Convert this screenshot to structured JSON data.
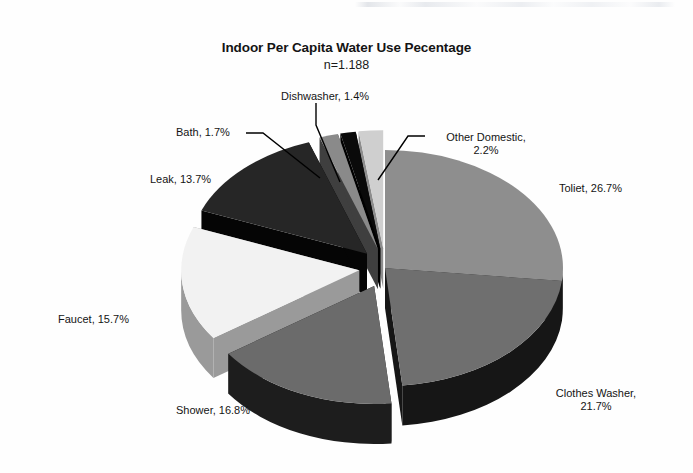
{
  "chart_data": {
    "type": "pie",
    "title": "Indoor Per Capita Water Use Pecentage",
    "subtitle": "n=1.188",
    "xlabel": "",
    "ylabel": "",
    "legend": "none",
    "style": "3d-exploded-pie",
    "grid": false,
    "units": "percent",
    "categories": [
      "Toliet",
      "Clothes Washer",
      "Shower",
      "Faucet",
      "Leak",
      "Bath",
      "Dishwasher",
      "Other Domestic"
    ],
    "values": [
      26.7,
      21.7,
      16.8,
      15.7,
      13.7,
      1.7,
      1.4,
      2.2
    ],
    "slices": [
      {
        "name": "Toliet",
        "value": 26.7,
        "label": "Toliet, 26.7%",
        "color": "#8e8e8e",
        "side_color": "#3a3a3a",
        "exploded": false
      },
      {
        "name": "Clothes Washer",
        "value": 21.7,
        "label": "Clothes Washer,|21.7%",
        "color": "#6f6f6f",
        "side_color": "#161616",
        "exploded": false
      },
      {
        "name": "Shower",
        "value": 16.8,
        "label": "Shower, 16.8%",
        "color": "#6b6b6b",
        "side_color": "#1d1d1d",
        "exploded": true
      },
      {
        "name": "Faucet",
        "value": 15.7,
        "label": "Faucet, 15.7%",
        "color": "#f2f2f2",
        "side_color": "#9a9a9a",
        "exploded": true
      },
      {
        "name": "Leak",
        "value": 13.7,
        "label": "Leak, 13.7%",
        "color": "#262626",
        "side_color": "#050505",
        "exploded": true
      },
      {
        "name": "Bath",
        "value": 1.7,
        "label": "Bath, 1.7%",
        "color": "#8a8a8a",
        "side_color": "#3f3f3f",
        "exploded": true
      },
      {
        "name": "Dishwasher",
        "value": 1.4,
        "label": "Dishwasher, 1.4%",
        "color": "#0a0a0a",
        "side_color": "#000000",
        "exploded": true
      },
      {
        "name": "Other Domestic",
        "value": 2.2,
        "label": "Other Domestic,|2.2%",
        "color": "#cfcfcf",
        "side_color": "#8d8d8d",
        "exploded": true
      }
    ]
  },
  "chart": {
    "title": "Indoor Per Capita Water Use Pecentage",
    "subtitle": "n=1.188",
    "labels": {
      "dishwasher": "Dishwasher, 1.4%",
      "bath": "Bath, 1.7%",
      "leak": "Leak, 13.7%",
      "other_domestic_line1": "Other Domestic,",
      "other_domestic_line2": "2.2%",
      "toilet": "Toliet, 26.7%",
      "clothes_washer_line1": "Clothes Washer,",
      "clothes_washer_line2": "21.7%",
      "faucet": "Faucet, 15.7%",
      "shower": "Shower, 16.8%"
    }
  },
  "colors": {
    "background": "#fefefe",
    "text": "#141414",
    "leader_line": "#000000",
    "toilet": "#8e8e8e",
    "clothes_washer": "#6f6f6f",
    "shower": "#6b6b6b",
    "faucet": "#f2f2f2",
    "leak": "#262626",
    "bath": "#8a8a8a",
    "dishwasher": "#0a0a0a",
    "other_domestic": "#cfcfcf"
  }
}
